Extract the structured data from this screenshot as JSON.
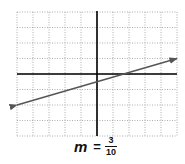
{
  "chart_data": {
    "type": "line",
    "title": "",
    "xlabel": "",
    "ylabel": "",
    "xlim": [
      -5,
      5
    ],
    "ylim": [
      -4,
      4
    ],
    "grid": true,
    "grid_style": "dotted",
    "grid_step": 1,
    "axes": {
      "x_axis_at_y": 0,
      "y_axis_at_x": 0
    },
    "series": [
      {
        "name": "line",
        "x": [
          -5,
          5
        ],
        "y": [
          -2,
          1
        ],
        "slope": 0.3,
        "y_intercept": -0.5,
        "arrows": "both"
      }
    ],
    "annotations": [
      "m = 3/10"
    ]
  },
  "caption": {
    "variable": "m",
    "equals": "=",
    "numerator": "3",
    "denominator": "10"
  },
  "colors": {
    "grid": "#9a9a9a",
    "axis": "#000000",
    "line": "#555555"
  }
}
